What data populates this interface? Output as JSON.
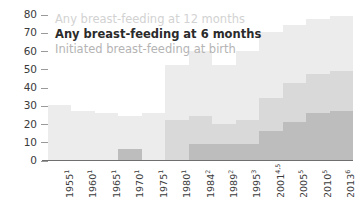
{
  "chart_data": {
    "type": "bar",
    "title": "",
    "subtitle": "",
    "xlabel": "",
    "ylabel": "",
    "ylim": [
      0,
      80
    ],
    "yticks": [
      0,
      10,
      20,
      30,
      40,
      50,
      60,
      70,
      80
    ],
    "grid": false,
    "legend_position": "top-left",
    "categories": [
      "1955",
      "1960",
      "1965",
      "1970",
      "1975",
      "1980",
      "1984",
      "1989",
      "1995",
      "2001",
      "2005",
      "2010",
      "2013"
    ],
    "category_superscripts": [
      "1",
      "1",
      "1",
      "1",
      "1",
      "1",
      "2",
      "2",
      "3",
      "4,5",
      "5",
      "5",
      "6"
    ],
    "category_labels": [
      "1955",
      "1960",
      "1965",
      "1970",
      "1975",
      "1980",
      "1984",
      "1989",
      "1995",
      "2001",
      "2005",
      "2010",
      "2013"
    ],
    "series": [
      {
        "name": "Initiated breast-feeding at birth",
        "key": "init",
        "color": "#ececec",
        "values": [
          30,
          27,
          26,
          24,
          26,
          52,
          60,
          52,
          60,
          70,
          74,
          77,
          79
        ]
      },
      {
        "name": "Any breast-feeding at 6 months",
        "key": "6mo",
        "color": "#d9d9d9",
        "values": [
          null,
          null,
          null,
          null,
          null,
          22,
          24,
          20,
          22,
          34,
          42,
          47,
          49
        ]
      },
      {
        "name": "Any breast-feeding at 12 months",
        "key": "12mo",
        "color": "#bdbdbd",
        "values": [
          null,
          null,
          null,
          6,
          null,
          null,
          9,
          9,
          9,
          16,
          21,
          26,
          27
        ]
      }
    ],
    "legend": [
      {
        "label": "Any breast-feeding at 12 months",
        "key": "12mo"
      },
      {
        "label": "Any breast-feeding at 6 months",
        "key": "6mo"
      },
      {
        "label": "Initiated breast-feeding at birth",
        "key": "init"
      }
    ],
    "colors": {
      "initiated": "#ececec",
      "six_months": "#d9d9d9",
      "twelve_months": "#bdbdbd",
      "axis": "#6f6f6f",
      "tick_text": "#3b3b3b"
    }
  }
}
